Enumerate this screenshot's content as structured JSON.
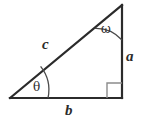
{
  "figure": {
    "kind": "geometry-diagram",
    "shape": "right-triangle",
    "background_color": "#ffffff",
    "stroke_color": "#2b2b2b",
    "arc_color": "#4a4a4a",
    "right_angle_color": "#8c8c8c"
  },
  "labels": {
    "hypotenuse": "c",
    "vertical_side": "a",
    "horizontal_side": "b",
    "top_angle": "ω",
    "left_angle": "θ",
    "right_angle": ""
  },
  "geometry": {
    "vertex_left": {
      "x": 10,
      "y": 98
    },
    "vertex_apex": {
      "x": 122,
      "y": 5
    },
    "vertex_corner": {
      "x": 122,
      "y": 98
    },
    "omega_arc_radius": 35,
    "theta_arc_radius": 38,
    "right_angle_mark_size": 15
  }
}
